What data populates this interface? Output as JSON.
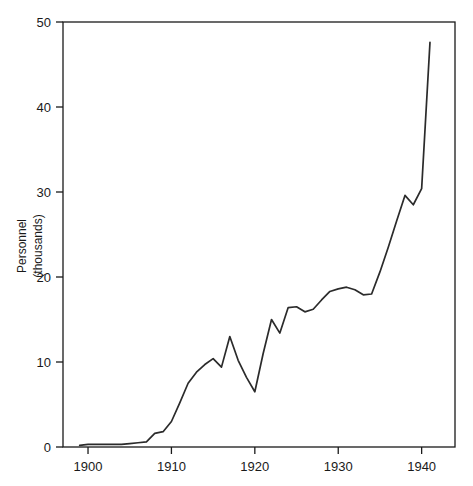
{
  "chart_data": {
    "type": "line",
    "title": "",
    "subtitle": "",
    "xlabel": "",
    "ylabel": "Personnel\n(thousands)",
    "ylabel_line1": "Personnel",
    "ylabel_line2": "(thousands)",
    "xlim": [
      1897,
      1944
    ],
    "ylim": [
      0,
      50
    ],
    "grid": false,
    "legend": "none",
    "x_ticks": [
      1900,
      1910,
      1920,
      1930,
      1940
    ],
    "x_tick_labels": [
      "1900",
      "1910",
      "1920",
      "1930",
      "1940"
    ],
    "y_ticks": [
      0,
      10,
      20,
      30,
      40,
      50
    ],
    "y_tick_labels": [
      "0",
      "10",
      "20",
      "30",
      "40",
      "50"
    ],
    "series": [
      {
        "name": "Personnel",
        "color": "#2b2b2b",
        "x": [
          1899,
          1900,
          1901,
          1902,
          1903,
          1904,
          1905,
          1906,
          1907,
          1908,
          1909,
          1910,
          1911,
          1912,
          1913,
          1914,
          1915,
          1916,
          1917,
          1918,
          1919,
          1920,
          1921,
          1922,
          1923,
          1924,
          1925,
          1926,
          1927,
          1928,
          1929,
          1930,
          1931,
          1932,
          1933,
          1934,
          1935,
          1936,
          1937,
          1938,
          1939,
          1940,
          1941
        ],
        "values": [
          0.2,
          0.3,
          0.3,
          0.3,
          0.3,
          0.3,
          0.4,
          0.5,
          0.6,
          1.6,
          1.8,
          3.0,
          5.2,
          7.5,
          8.8,
          9.7,
          10.4,
          9.4,
          13.0,
          10.2,
          8.2,
          6.5,
          11.0,
          15.0,
          13.4,
          16.4,
          16.5,
          15.9,
          16.2,
          17.3,
          18.3,
          18.6,
          18.8,
          18.5,
          17.9,
          18.0,
          20.6,
          23.5,
          26.6,
          29.6,
          28.5,
          30.4,
          47.6
        ]
      }
    ]
  },
  "axes": {
    "plot_left_px": 63,
    "plot_right_px": 455,
    "plot_top_px": 22,
    "plot_bottom_px": 447
  }
}
